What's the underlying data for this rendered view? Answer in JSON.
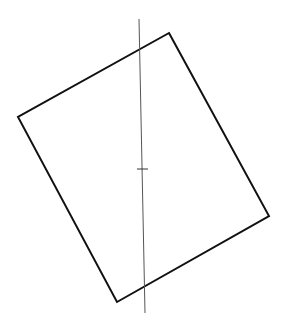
{
  "diagram": {
    "background": "#ffffff",
    "rectangle": {
      "stroke": "#111111",
      "stroke_width": 2,
      "points": [
        [
          169,
          33
        ],
        [
          269,
          216
        ],
        [
          117,
          302
        ],
        [
          18,
          117
        ]
      ]
    },
    "axis_line": {
      "stroke": "#555555",
      "stroke_width": 1,
      "x1": 139,
      "y1": 19,
      "x2": 145,
      "y2": 313
    },
    "center_tick": {
      "stroke": "#333333",
      "stroke_width": 1,
      "x1": 137,
      "y1": 169,
      "x2": 148,
      "y2": 169
    }
  }
}
